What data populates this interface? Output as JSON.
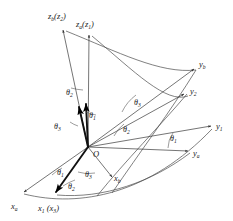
{
  "figure": {
    "type": "euler-angle-rotation-diagram",
    "background_color": "#ffffff",
    "line_color": "#3a3a3a",
    "bold_line_color": "#111111",
    "origin": {
      "label": "O",
      "x": 88,
      "y": 147
    }
  },
  "axes": [
    {
      "id": "zb-z2",
      "base": "z",
      "base_sub": "b",
      "alt": "z",
      "alt_sub": "2",
      "label_text": "z",
      "label_sub": "b",
      "label_paren_base": "z",
      "label_paren_sub": "2",
      "tip_x": 62,
      "tip_y": 27,
      "label_x": 48,
      "label_y": 19,
      "weight": "thin"
    },
    {
      "id": "za-z1",
      "base": "z",
      "base_sub": "a",
      "alt": "z",
      "alt_sub": "1",
      "label_text": "z",
      "label_sub": "a",
      "label_paren_base": "z",
      "label_paren_sub": "1",
      "tip_x": 89,
      "tip_y": 32,
      "label_x": 76,
      "label_y": 26,
      "weight": "thin"
    },
    {
      "id": "yb",
      "label_text": "y",
      "label_sub": "b",
      "tip_x": 196,
      "tip_y": 66,
      "label_x": 199,
      "label_y": 66,
      "weight": "thin"
    },
    {
      "id": "y2",
      "label_text": "y",
      "label_sub": "2",
      "tip_x": 186,
      "tip_y": 92,
      "label_x": 190,
      "label_y": 94,
      "weight": "thin"
    },
    {
      "id": "y1",
      "label_text": "y",
      "label_sub": "1",
      "tip_x": 213,
      "tip_y": 126,
      "label_x": 216,
      "label_y": 128,
      "weight": "thin"
    },
    {
      "id": "ya",
      "label_text": "y",
      "label_sub": "a",
      "tip_x": 190,
      "tip_y": 151,
      "label_x": 193,
      "label_y": 155,
      "weight": "thin"
    },
    {
      "id": "xa",
      "label_text": "x",
      "label_sub": "a",
      "tip_x": 22,
      "tip_y": 193,
      "label_x": 13,
      "label_y": 208,
      "weight": "thin"
    },
    {
      "id": "x1-x3",
      "label_text": "x",
      "label_sub": "1",
      "label_paren_base": "x",
      "label_paren_sub": "3",
      "tip_x": 55,
      "tip_y": 194,
      "label_x": 41,
      "label_y": 210,
      "weight": "bold"
    },
    {
      "id": "xb",
      "label_text": "x",
      "label_sub": "b",
      "tip_x": 113,
      "tip_y": 178,
      "label_x": 115,
      "label_y": 180,
      "weight": "thin"
    }
  ],
  "angle_labels": [
    {
      "id": "theta2-upper",
      "symbol": "θ",
      "sub": "2",
      "x": 70,
      "y": 94
    },
    {
      "id": "theta1-upper",
      "symbol": "θ",
      "sub": "1",
      "x": 92,
      "y": 117
    },
    {
      "id": "theta3-left",
      "symbol": "θ",
      "sub": "3",
      "x": 58,
      "y": 128
    },
    {
      "id": "theta3-right",
      "symbol": "θ",
      "sub": "3",
      "x": 137,
      "y": 104
    },
    {
      "id": "theta2-right",
      "symbol": "θ",
      "sub": "2",
      "x": 126,
      "y": 131
    },
    {
      "id": "theta1-right",
      "symbol": "θ",
      "sub": "1",
      "x": 173,
      "y": 140
    },
    {
      "id": "theta1-lower",
      "symbol": "θ",
      "sub": "1",
      "x": 60,
      "y": 174
    },
    {
      "id": "theta3-lower",
      "symbol": "θ",
      "sub": "3",
      "x": 88,
      "y": 176
    },
    {
      "id": "theta2-lower",
      "symbol": "θ",
      "sub": "2",
      "x": 71,
      "y": 188
    }
  ],
  "origin_label": {
    "text": "O",
    "x": 93,
    "y": 156
  }
}
